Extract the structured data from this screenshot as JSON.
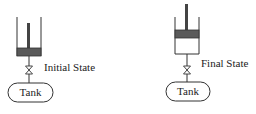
{
  "diagram": {
    "type": "piston-cylinder-tank schematic",
    "colors": {
      "line": "#333333",
      "piston": "#555555",
      "rod": "#444444",
      "background": "#ffffff"
    },
    "states": [
      {
        "id": "initial",
        "label": "Initial State",
        "tank_label": "Tank",
        "piston_position": "bottom",
        "components": [
          "cylinder",
          "piston",
          "piston-rod",
          "pipe",
          "valve",
          "tank"
        ]
      },
      {
        "id": "final",
        "label": "Final State",
        "tank_label": "Tank",
        "piston_position": "raised",
        "components": [
          "cylinder",
          "piston",
          "piston-rod",
          "pipe",
          "valve",
          "tank"
        ]
      }
    ]
  }
}
